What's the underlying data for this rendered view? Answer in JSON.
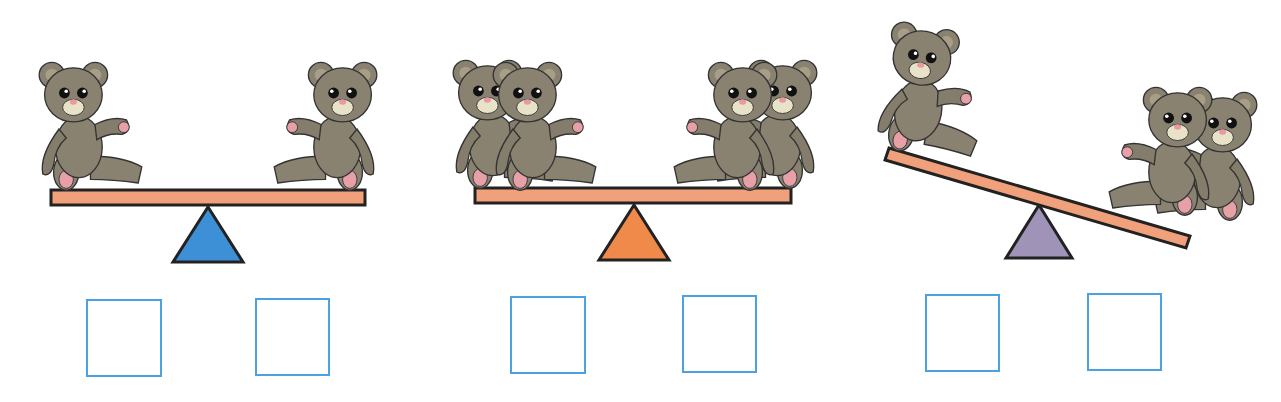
{
  "worksheet": {
    "colors": {
      "plank": "#f0a07a",
      "outline": "#222222",
      "bear_fur": "#8a8270",
      "bear_dark": "#6e6656",
      "bear_muzzle": "#e8e2c8",
      "bear_nose": "#e89aa0",
      "answer_box_border": "#4aa3e0"
    },
    "scenes": [
      {
        "id": "scene-1",
        "fulcrum_color": "#3d8fd6",
        "tilt": "balanced",
        "left_bears": 1,
        "right_bears": 1,
        "answers": [
          "",
          ""
        ]
      },
      {
        "id": "scene-2",
        "fulcrum_color": "#f08a4b",
        "tilt": "balanced",
        "left_bears": 2,
        "right_bears": 2,
        "answers": [
          "",
          ""
        ]
      },
      {
        "id": "scene-3",
        "fulcrum_color": "#9f93b8",
        "tilt": "right-down",
        "left_bears": 1,
        "right_bears": 2,
        "answers": [
          "",
          ""
        ]
      }
    ]
  }
}
